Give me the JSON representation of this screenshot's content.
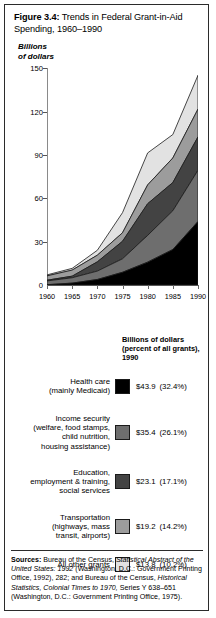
{
  "figure": {
    "title_label": "Figure 3.4:",
    "title_text": " Trends in Federal Grant-in-Aid",
    "title_line2": "Spending, 1960–1990"
  },
  "chart_data": {
    "type": "area",
    "title": "Trends in Federal Grant-in-Aid Spending, 1960–1990",
    "subtitle": "",
    "xlabel": "",
    "ylabel": "Billions\nof dollars",
    "x": [
      1960,
      1965,
      1970,
      1975,
      1980,
      1985,
      1990
    ],
    "xlim": [
      1960,
      1990
    ],
    "ylim": [
      0,
      150
    ],
    "yticks": [
      0,
      30,
      60,
      90,
      120,
      150
    ],
    "xticks": [
      1960,
      1965,
      1970,
      1975,
      1980,
      1985,
      1990
    ],
    "ytick_labels": [
      "0",
      "30",
      "60",
      "90",
      "120",
      "150"
    ],
    "xtick_labels": [
      "1960",
      "1965",
      "1970",
      "1975",
      "1980",
      "1985",
      "1990"
    ],
    "grid": false,
    "legend_position": "below",
    "stacked": true,
    "series": [
      {
        "name": "Health care (mainly Medicaid)",
        "color": "#000000",
        "values": [
          0.2,
          1.3,
          3.8,
          8.8,
          15.8,
          24.5,
          43.9
        ]
      },
      {
        "name": "Income security (welfare, food stamps, child nutrition, housing assistance)",
        "color": "#6e6e6e",
        "values": [
          2.6,
          3.7,
          5.8,
          9.3,
          18.5,
          26.8,
          35.4
        ]
      },
      {
        "name": "Education, employment & training, social services",
        "color": "#434343",
        "values": [
          0.5,
          1.1,
          6.4,
          12.1,
          21.9,
          19.5,
          23.1
        ]
      },
      {
        "name": "Transportation (highways, mass transit, airports)",
        "color": "#9c9c9c",
        "values": [
          3.0,
          4.2,
          4.6,
          5.9,
          13.0,
          17.0,
          19.2
        ]
      },
      {
        "name": "All other grants",
        "color": "#e2e2e2",
        "values": [
          0.7,
          1.2,
          3.4,
          13.9,
          22.1,
          16.2,
          23.4
        ]
      }
    ],
    "totals": [
      7.0,
      11.5,
      24.0,
      50.0,
      91.3,
      104.0,
      145.0
    ]
  },
  "legend": {
    "header": "Billions of dollars (percent of all grants), 1990",
    "items": [
      {
        "label": "Health care\n(mainly Medicaid)",
        "color": "#000000",
        "amount": "$43.9",
        "percent": "(32.4%)"
      },
      {
        "label": "Income security\n(welfare, food stamps,\nchild nutrition,\nhousing assistance)",
        "color": "#6e6e6e",
        "amount": "$35.4",
        "percent": "(26.1%)"
      },
      {
        "label": "Education,\nemployment & training,\nsocial services",
        "color": "#434343",
        "amount": "$23.1",
        "percent": "(17.1%)"
      },
      {
        "label": "Transportation\n(highways, mass\ntransit, airports)",
        "color": "#9c9c9c",
        "amount": "$19.2",
        "percent": "(14.2%)"
      },
      {
        "label": "All other grants",
        "color": "#e2e2e2",
        "amount": "$13.8",
        "percent": "(10.2%)"
      }
    ]
  },
  "sources": {
    "label": "Sources:",
    "part1": " Bureau of the Census, ",
    "ital1": "Statistical Abstract of the United States: 1992",
    "part2": " (Washington, D.C.: Government Printing Office, 1992), 282; and Bureau of the Census, ",
    "ital2": "Historical Statistics, Colonial Times to 1970,",
    "part3": " Series Y 638–651 (Washington, D.C.: Government Printing Office, 1975)."
  }
}
